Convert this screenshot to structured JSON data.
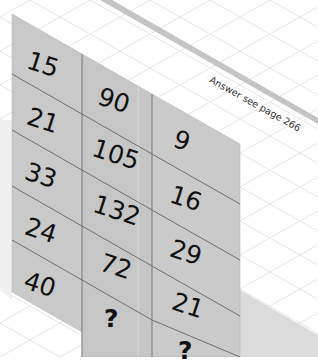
{
  "puzzle": {
    "columns": [
      {
        "values": [
          "15",
          "21",
          "33",
          "24",
          "40"
        ]
      },
      {
        "values": [
          "90",
          "105",
          "132",
          "72",
          "?"
        ]
      },
      {
        "values": [
          "9",
          "16",
          "29",
          "21",
          "?"
        ]
      }
    ],
    "caption": "Answer see page 266"
  },
  "colors": {
    "panel": "#c8c8c8",
    "panel_divider": "#7a7a7a",
    "grid_line": "#e6e6e6",
    "shelf_edge": "#bdbdbd",
    "shadow": "#d9d9d9",
    "text": "#111111"
  }
}
